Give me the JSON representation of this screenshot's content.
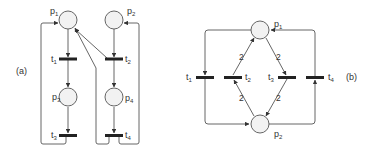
{
  "colors": {
    "stroke": "#555555",
    "place_fill": "#f2f2f2",
    "transition_fill": "#222222",
    "text": "#333333"
  },
  "diagram_a": {
    "tag": "(a)",
    "places": [
      {
        "id": "p1",
        "label": "p",
        "sub": "1"
      },
      {
        "id": "p2",
        "label": "p",
        "sub": "2"
      },
      {
        "id": "p3",
        "label": "p",
        "sub": "3"
      },
      {
        "id": "p4",
        "label": "p",
        "sub": "4"
      }
    ],
    "transitions": [
      {
        "id": "t1",
        "label": "t",
        "sub": "1"
      },
      {
        "id": "t2",
        "label": "t",
        "sub": "2"
      },
      {
        "id": "t3",
        "label": "t",
        "sub": "3"
      },
      {
        "id": "t4",
        "label": "t",
        "sub": "4"
      }
    ],
    "arcs": [
      {
        "from": "p1",
        "to": "t1"
      },
      {
        "from": "t1",
        "to": "p3"
      },
      {
        "from": "p3",
        "to": "t3"
      },
      {
        "from": "t3",
        "to": "p1"
      },
      {
        "from": "p2",
        "to": "t2"
      },
      {
        "from": "t2",
        "to": "p4"
      },
      {
        "from": "p4",
        "to": "t4"
      },
      {
        "from": "t4",
        "to": "p2"
      },
      {
        "from": "t4",
        "to": "p1"
      },
      {
        "from": "t2",
        "to": "p1"
      }
    ]
  },
  "diagram_b": {
    "tag": "(b)",
    "places": [
      {
        "id": "p1",
        "label": "p",
        "sub": "1"
      },
      {
        "id": "p2",
        "label": "p",
        "sub": "2"
      }
    ],
    "transitions": [
      {
        "id": "t1",
        "label": "t",
        "sub": "1"
      },
      {
        "id": "t2",
        "label": "t",
        "sub": "2"
      },
      {
        "id": "t3",
        "label": "t",
        "sub": "3"
      },
      {
        "id": "t4",
        "label": "t",
        "sub": "4"
      }
    ],
    "arcs": [
      {
        "from": "p1",
        "to": "t1"
      },
      {
        "from": "t1",
        "to": "p2"
      },
      {
        "from": "t2",
        "to": "p1",
        "weight": "2"
      },
      {
        "from": "p2",
        "to": "t2",
        "weight": "2"
      },
      {
        "from": "p1",
        "to": "t3",
        "weight": "2"
      },
      {
        "from": "t3",
        "to": "p2",
        "weight": "2"
      },
      {
        "from": "p2",
        "to": "t4"
      },
      {
        "from": "t4",
        "to": "p1"
      }
    ],
    "weights": [
      "2",
      "2",
      "2",
      "2"
    ]
  }
}
